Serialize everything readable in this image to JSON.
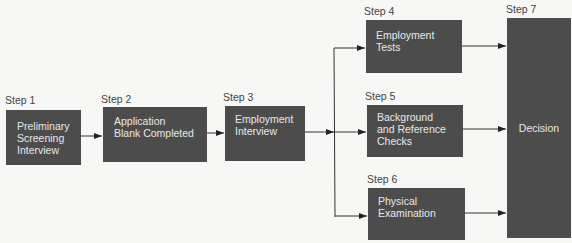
{
  "diagram": {
    "type": "flowchart",
    "steps": [
      {
        "id": 1,
        "label": "Step 1",
        "text": "Preliminary\nScreening\nInterview"
      },
      {
        "id": 2,
        "label": "Step 2",
        "text": "Application\nBlank Completed"
      },
      {
        "id": 3,
        "label": "Step 3",
        "text": "Employment\nInterview"
      },
      {
        "id": 4,
        "label": "Step 4",
        "text": "Employment\nTests"
      },
      {
        "id": 5,
        "label": "Step 5",
        "text": "Background\nand Reference\nChecks"
      },
      {
        "id": 6,
        "label": "Step 6",
        "text": "Physical\nExamination"
      },
      {
        "id": 7,
        "label": "Step 7",
        "text": "Decision"
      }
    ],
    "edges": [
      {
        "from": 1,
        "to": 2
      },
      {
        "from": 2,
        "to": 3
      },
      {
        "from": 3,
        "to": 4
      },
      {
        "from": 3,
        "to": 5
      },
      {
        "from": 3,
        "to": 6
      },
      {
        "from": 4,
        "to": 7
      },
      {
        "from": 5,
        "to": 7
      },
      {
        "from": 6,
        "to": 7
      }
    ],
    "colors": {
      "box_fill": "#4d4c4c",
      "box_text": "#e8e8e8",
      "line": "#333333",
      "background": "#f7f7f5"
    }
  }
}
